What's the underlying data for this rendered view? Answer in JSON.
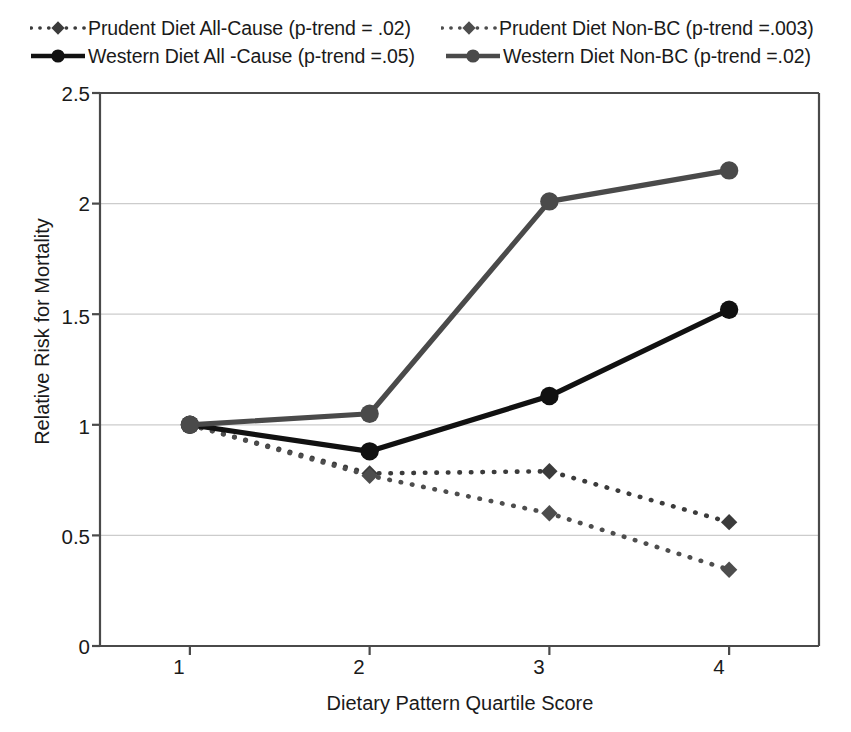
{
  "chart_data": {
    "type": "line",
    "title": "",
    "xlabel": "Dietary Pattern Quartile Score",
    "ylabel": "Relative Risk for Mortality",
    "x": [
      1,
      2,
      3,
      4
    ],
    "xtick_labels": [
      "1",
      "2",
      "3",
      "4"
    ],
    "ytick_labels": [
      "0",
      "0.5",
      "1",
      "1.5",
      "2",
      "2.5"
    ],
    "ytick_values": [
      0,
      0.5,
      1,
      1.5,
      2,
      2.5
    ],
    "ylim": [
      0,
      2.5
    ],
    "xlim": [
      0.5,
      4.5
    ],
    "grid": "horizontal",
    "legend_position": "top",
    "series": [
      {
        "name": "Prudent Diet All-Cause (p-trend = .02)",
        "short_name": "Prudent Diet All-Cause",
        "p_trend": ".02",
        "values": [
          1.0,
          0.78,
          0.79,
          0.56
        ],
        "line_style": "dotted",
        "color": "#3b3b3b",
        "marker": "diamond"
      },
      {
        "name": "Prudent Diet Non-BC (p-trend =.003)",
        "short_name": "Prudent Diet Non-BC",
        "p_trend": ".003",
        "values": [
          1.0,
          0.77,
          0.6,
          0.345
        ],
        "line_style": "dotted",
        "color": "#4d4d4d",
        "marker": "diamond"
      },
      {
        "name": "Western Diet All -Cause (p-trend =.05)",
        "short_name": "Western Diet All -Cause",
        "p_trend": ".05",
        "values": [
          1.0,
          0.88,
          1.13,
          1.52
        ],
        "line_style": "solid",
        "color": "#111111",
        "marker": "circle"
      },
      {
        "name": "Western Diet Non-BC (p-trend =.02)",
        "short_name": "Western Diet Non-BC",
        "p_trend": ".02",
        "values": [
          1.0,
          1.05,
          2.01,
          2.15
        ],
        "line_style": "solid",
        "color": "#4a4a4a",
        "marker": "circle"
      }
    ]
  },
  "legend": {
    "rows": [
      {
        "items": [
          {
            "label": "Prudent Diet All-Cause (p-trend = .02)",
            "series_index": 0
          },
          {
            "label": "Prudent Diet Non-BC (p-trend =.003)",
            "series_index": 1
          }
        ]
      },
      {
        "items": [
          {
            "label": "Western Diet All -Cause (p-trend =.05)",
            "series_index": 2
          },
          {
            "label": "Western Diet Non-BC (p-trend =.02)",
            "series_index": 3
          }
        ]
      }
    ]
  },
  "axes": {
    "y_title": "Relative Risk for Mortality",
    "x_title": "Dietary Pattern Quartile Score",
    "y_labels": [
      "2.5",
      "2",
      "1.5",
      "1",
      "0.5",
      "0"
    ],
    "x_labels": [
      "1",
      "2",
      "3",
      "4"
    ]
  },
  "colors": {
    "axis": "#4a4a4a",
    "grid": "#cccccc",
    "text": "#1a1a1a",
    "prudent_all_cause": "#3b3b3b",
    "prudent_non_bc": "#4d4d4d",
    "western_all_cause": "#111111",
    "western_non_bc": "#4a4a4a",
    "background": "#ffffff"
  }
}
